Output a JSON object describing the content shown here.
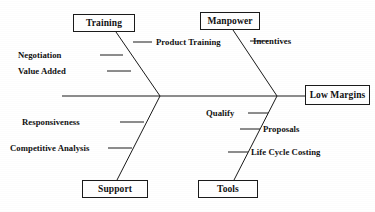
{
  "diagram": {
    "type": "fishbone-ishikawa",
    "effect": {
      "label": "Low Margins",
      "box": {
        "x": 305,
        "y": 85,
        "w": 65,
        "h": 20
      }
    },
    "spine": {
      "x1": 62,
      "y1": 96,
      "x2": 305,
      "y2": 96
    },
    "vertices": {
      "left": {
        "x": 160,
        "y": 96
      },
      "right": {
        "x": 277,
        "y": 96
      }
    },
    "categories": [
      {
        "id": "training",
        "label": "Training",
        "position": "top-left",
        "box": {
          "x": 73,
          "y": 14,
          "w": 62,
          "h": 18
        },
        "bone": {
          "x1": 116,
          "y1": 32,
          "x2": 160,
          "y2": 96
        },
        "causes": [
          {
            "label": "Product Training",
            "side": "right",
            "tick": {
              "x1": 133,
              "y1": 42,
              "x2": 152,
              "y2": 42
            },
            "text": {
              "x": 156,
              "y": 37
            }
          },
          {
            "label": "Negotiation",
            "side": "left",
            "tick": {
              "x1": 100,
              "y1": 55,
              "x2": 123,
              "y2": 55
            },
            "text": {
              "x": 18,
              "y": 50
            }
          },
          {
            "label": "Value Added",
            "side": "left",
            "tick": {
              "x1": 107,
              "y1": 71,
              "x2": 131,
              "y2": 71
            },
            "text": {
              "x": 18,
              "y": 66
            }
          }
        ]
      },
      {
        "id": "manpower",
        "label": "Manpower",
        "position": "top-right",
        "box": {
          "x": 200,
          "y": 12,
          "w": 60,
          "h": 18
        },
        "bone": {
          "x1": 233,
          "y1": 30,
          "x2": 277,
          "y2": 96
        },
        "causes": [
          {
            "label": "Incentives",
            "side": "right",
            "tick": {
              "x1": 250,
              "y1": 41,
              "x2": 268,
              "y2": 41
            },
            "text": {
              "x": 253,
              "y": 36
            }
          }
        ]
      },
      {
        "id": "support",
        "label": "Support",
        "position": "bottom-left",
        "box": {
          "x": 82,
          "y": 180,
          "w": 66,
          "h": 18
        },
        "bone": {
          "x1": 160,
          "y1": 96,
          "x2": 117,
          "y2": 180
        },
        "causes": [
          {
            "label": "Responsiveness",
            "side": "left",
            "tick": {
              "x1": 120,
              "y1": 122,
              "x2": 144,
              "y2": 122
            },
            "text": {
              "x": 22,
              "y": 117
            }
          },
          {
            "label": "Competitive Analysis",
            "side": "left",
            "tick": {
              "x1": 108,
              "y1": 148,
              "x2": 132,
              "y2": 148
            },
            "text": {
              "x": 10,
              "y": 143
            }
          }
        ]
      },
      {
        "id": "tools",
        "label": "Tools",
        "position": "bottom-right",
        "box": {
          "x": 198,
          "y": 180,
          "w": 60,
          "h": 18
        },
        "bone": {
          "x1": 277,
          "y1": 96,
          "x2": 234,
          "y2": 180
        },
        "causes": [
          {
            "label": "Qualify",
            "side": "left",
            "tick": {
              "x1": 248,
              "y1": 113,
              "x2": 268,
              "y2": 113
            },
            "text": {
              "x": 206,
              "y": 108
            }
          },
          {
            "label": "Proposals",
            "side": "right",
            "tick": {
              "x1": 240,
              "y1": 129,
              "x2": 260,
              "y2": 129
            },
            "text": {
              "x": 263,
              "y": 124
            }
          },
          {
            "label": "Life Cycle Costing",
            "side": "right",
            "tick": {
              "x1": 228,
              "y1": 152,
              "x2": 248,
              "y2": 152
            },
            "text": {
              "x": 251,
              "y": 147
            }
          }
        ]
      }
    ],
    "style": {
      "line_color": "#1a1a1a",
      "text_color": "#111111",
      "background": "#ffffff",
      "line_width": 1
    }
  }
}
